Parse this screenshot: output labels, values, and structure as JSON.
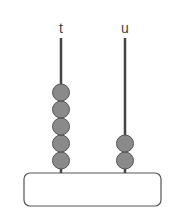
{
  "abacus": {
    "rods": [
      {
        "label": "t",
        "beads": 5,
        "x": 61
      },
      {
        "label": "u",
        "beads": 2,
        "x": 125
      }
    ],
    "bead_color": "#8a8a8a",
    "bead_stroke": "#555555",
    "rod_color": "#444444"
  }
}
